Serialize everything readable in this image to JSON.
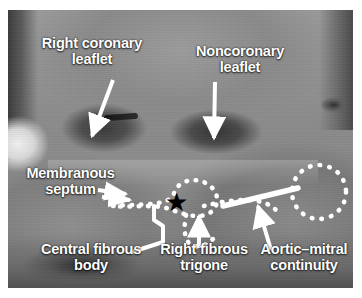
{
  "figure": {
    "type": "anatomical-specimen-photograph",
    "modality": "grayscale gross anatomy photograph with white annotations"
  },
  "labels": {
    "right_coronary_leaflet": "Right coronary\nleaflet",
    "noncoronary_leaflet": "Noncoronary\nleaflet",
    "membranous_septum": "Membranous\nseptum",
    "central_fibrous_body": "Central fibrous\nbody",
    "right_fibrous_trigone": "Right fibrous\ntrigone",
    "aortic_mitral_continuity": "Aortic–mitral\ncontinuity"
  },
  "markers": {
    "star": "★",
    "star_meaning": "central fibrous body",
    "annotation_color": "#ffffff",
    "star_color": "#000000"
  },
  "annotations": [
    {
      "name": "arrow-right-coronary-leaflet",
      "kind": "arrow",
      "direction": "down-left",
      "points_to": "right coronary sinus"
    },
    {
      "name": "arrow-noncoronary-leaflet",
      "kind": "arrow",
      "direction": "down",
      "points_to": "noncoronary sinus"
    },
    {
      "name": "arrow-membranous-septum",
      "kind": "double-arrow",
      "direction": "right",
      "points_to": "membranous septum outline"
    },
    {
      "name": "dotted-outline-membranous-septum",
      "kind": "dotted-outline",
      "shape": "loop"
    },
    {
      "name": "dotted-outline-aortic-mitral",
      "kind": "dotted-outline",
      "shape": "circle"
    },
    {
      "name": "leader-central-fibrous-body",
      "kind": "zigzag-leader",
      "points_to": "star"
    },
    {
      "name": "arrow-right-fibrous-trigone",
      "kind": "arrow",
      "direction": "up"
    },
    {
      "name": "line-aortic-mitral-continuity",
      "kind": "thick-line"
    },
    {
      "name": "arrow-aortic-mitral-continuity",
      "kind": "arrow",
      "direction": "up-right"
    }
  ]
}
